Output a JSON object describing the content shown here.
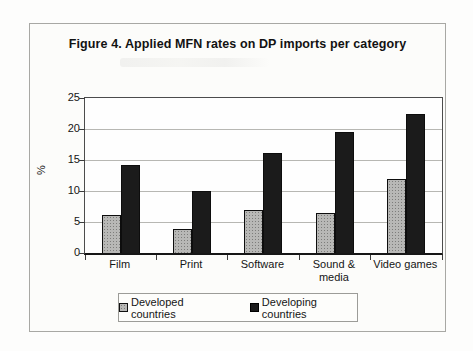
{
  "figure": {
    "title": "Figure 4. Applied MFN rates on DP imports per category"
  },
  "chart_data": {
    "type": "bar",
    "title": "Figure 4. Applied MFN rates on DP imports per category",
    "categories": [
      "Film",
      "Print",
      "Software",
      "Sound & media",
      "Video games"
    ],
    "series": [
      {
        "name": "Developed countries",
        "color": "#b8b8b6",
        "values": [
          6.2,
          3.9,
          6.9,
          6.5,
          12.0
        ]
      },
      {
        "name": "Developing countries",
        "color": "#1b1b1b",
        "values": [
          14.2,
          10.0,
          16.2,
          19.5,
          22.5
        ]
      }
    ],
    "xlabel": "",
    "ylabel": "%",
    "ylim": [
      0,
      25
    ],
    "ytick_step": 5,
    "ytick_labels": [
      "0",
      "5",
      "10",
      "15",
      "20",
      "25"
    ],
    "grid": true,
    "legend_position": "bottom",
    "bar_outline_color": "#0d0d0d",
    "gridline_color": "#b7b7b3"
  }
}
